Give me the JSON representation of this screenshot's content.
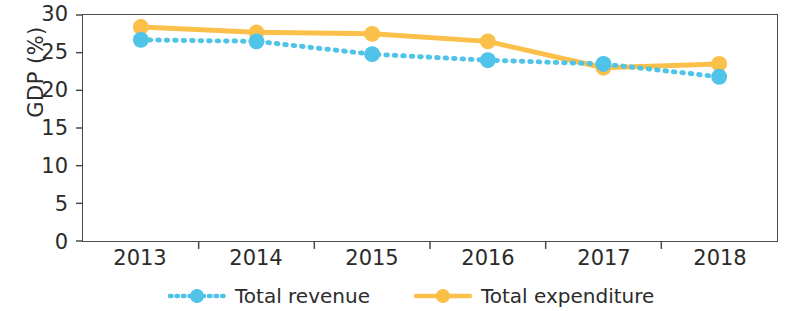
{
  "chart_data": {
    "type": "line",
    "title": "",
    "subtitle": "",
    "xlabel": "",
    "ylabel": "GDP (%)",
    "categories": [
      "2013",
      "2014",
      "2015",
      "2016",
      "2017",
      "2018"
    ],
    "x": [
      2013,
      2014,
      2015,
      2016,
      2017,
      2018
    ],
    "ylim": [
      0,
      30
    ],
    "yticks": [
      0,
      5,
      10,
      15,
      20,
      25,
      30
    ],
    "ytick_labels": [
      "0",
      "5",
      "10",
      "15",
      "20",
      "25",
      "30"
    ],
    "grid": false,
    "legend_position": "bottom",
    "series": [
      {
        "name": "Total revenue",
        "color": "#4FC3E8",
        "line_style": "dotted",
        "marker": "circle",
        "values": [
          26.7,
          26.5,
          24.8,
          24.0,
          23.5,
          21.8
        ]
      },
      {
        "name": "Total expenditure",
        "color": "#FBC04A",
        "line_style": "solid",
        "marker": "circle",
        "values": [
          28.4,
          27.7,
          27.5,
          26.5,
          23.0,
          23.5
        ]
      }
    ]
  },
  "axes": {
    "y_title": "GDP (%)"
  },
  "colors": {
    "revenue": "#4FC3E8",
    "expenditure": "#FBC04A",
    "axis": "#4a4a4a",
    "text": "#2b2b2b"
  }
}
